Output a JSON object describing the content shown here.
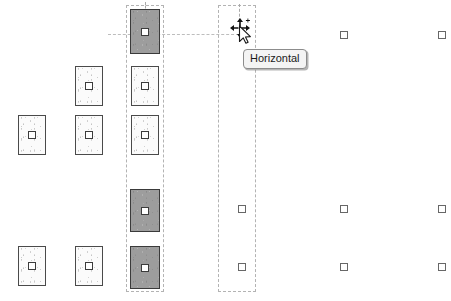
{
  "canvas": {
    "width": 451,
    "height": 301,
    "background": "#ffffff",
    "name": "drawing-canvas"
  },
  "tooltip": {
    "label": "Horizontal",
    "x": 243,
    "y": 49,
    "border_color": "#8c8c8c",
    "background_color": "#f4f4f4"
  },
  "cursor": {
    "icon": "move-cursor-icon",
    "x": 228,
    "y": 16
  },
  "colors": {
    "fixture_fill": "#fbfbfb",
    "fixture_selected_fill": "#9d9d9d",
    "fixture_border": "#4a4a4a",
    "marker_border": "#676767",
    "selection_dash": "#b3b3b3",
    "guide_dash": "#bdbdbd"
  },
  "guides": {
    "horizontal": [
      {
        "name": "guide-horizontal-align",
        "x": 108,
        "y": 34,
        "length": 131
      }
    ],
    "vertical": [
      {
        "name": "guide-vertical-drag",
        "x": 239,
        "y": 4,
        "length": 32
      },
      {
        "name": "guide-vertical-top-stub",
        "x": 145,
        "y": 2,
        "length": 10
      }
    ]
  },
  "select_columns": [
    {
      "name": "select-column-left",
      "x": 126,
      "y": 5,
      "width": 38,
      "height": 287
    },
    {
      "name": "select-column-right",
      "x": 218,
      "y": 5,
      "width": 38,
      "height": 287
    }
  ],
  "fixtures": [
    {
      "name": "fixture-c3-r1",
      "x": 130,
      "y": 9,
      "width": 30,
      "height": 45,
      "state": "selected"
    },
    {
      "name": "fixture-c2-r2",
      "x": 75,
      "y": 66,
      "width": 28,
      "height": 40,
      "state": "plain"
    },
    {
      "name": "fixture-c3-r2",
      "x": 131,
      "y": 66,
      "width": 28,
      "height": 40,
      "state": "plain"
    },
    {
      "name": "fixture-c1-r3",
      "x": 18,
      "y": 115,
      "width": 28,
      "height": 40,
      "state": "plain"
    },
    {
      "name": "fixture-c2-r3",
      "x": 75,
      "y": 115,
      "width": 28,
      "height": 40,
      "state": "plain"
    },
    {
      "name": "fixture-c3-r3",
      "x": 131,
      "y": 115,
      "width": 28,
      "height": 40,
      "state": "plain"
    },
    {
      "name": "fixture-c3-r4",
      "x": 130,
      "y": 189,
      "width": 30,
      "height": 43,
      "state": "selected"
    },
    {
      "name": "fixture-c1-r5",
      "x": 18,
      "y": 246,
      "width": 28,
      "height": 40,
      "state": "plain"
    },
    {
      "name": "fixture-c2-r5",
      "x": 75,
      "y": 246,
      "width": 28,
      "height": 40,
      "state": "plain"
    },
    {
      "name": "fixture-c3-r5",
      "x": 130,
      "y": 246,
      "width": 30,
      "height": 43,
      "state": "selected"
    }
  ],
  "markers": [
    {
      "name": "marker-c5-r1",
      "x": 340,
      "y": 31
    },
    {
      "name": "marker-c6-r1",
      "x": 438,
      "y": 31
    },
    {
      "name": "marker-c4-r4",
      "x": 238,
      "y": 205
    },
    {
      "name": "marker-c5-r4",
      "x": 340,
      "y": 205
    },
    {
      "name": "marker-c6-r4",
      "x": 438,
      "y": 205
    },
    {
      "name": "marker-c4-r5",
      "x": 238,
      "y": 263
    },
    {
      "name": "marker-c5-r5",
      "x": 340,
      "y": 263
    },
    {
      "name": "marker-c6-r5",
      "x": 438,
      "y": 263
    }
  ]
}
